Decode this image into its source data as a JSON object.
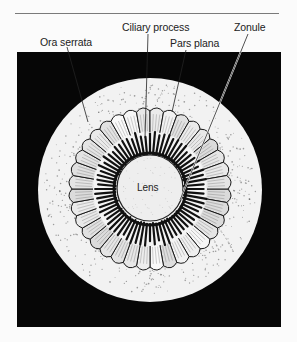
{
  "figure": {
    "labels": {
      "ora_serrata": "Ora serrata",
      "ciliary_process": "Ciliary process",
      "pars_plana": "Pars plana",
      "zonule": "Zonule",
      "lens": "Lens"
    },
    "colors": {
      "background": "#fbfbfb",
      "frame": "#060606",
      "globe": "#f2f2f2",
      "ink": "#1a1a1a",
      "rule": "#7a7a7a"
    },
    "ciliary_process_count": 72,
    "pars_plana_fold_count": 36
  }
}
